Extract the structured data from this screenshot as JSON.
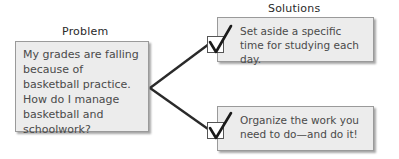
{
  "diagram": {
    "type": "problem-solution",
    "problem": {
      "heading": "Problem",
      "text": "My grades are falling because of basketball practice. How do I manage basketball and schoolwork?"
    },
    "solutions_heading": "Solutions",
    "solutions": [
      {
        "text": "Set aside a specific time for studying each day.",
        "icon": "checkmark-icon"
      },
      {
        "text": "Organize the work you need to do—and do it!",
        "icon": "checkmark-icon"
      }
    ],
    "colors": {
      "box_fill": "#ececec",
      "box_border": "#9a9a9a",
      "line": "#2a2a2a"
    }
  }
}
